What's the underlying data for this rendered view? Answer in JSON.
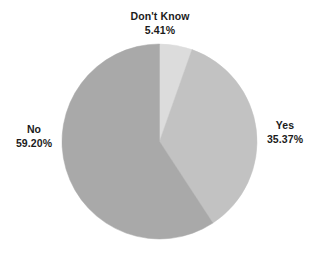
{
  "chart_data": {
    "type": "pie",
    "title": "",
    "subtitle": "",
    "xlabel": "",
    "ylabel": "",
    "legend_position": "none",
    "grid": false,
    "start_angle_deg": 0,
    "direction": "clockwise",
    "units": "percent",
    "categories": [
      "Don't Know",
      "Yes",
      "No"
    ],
    "values": [
      5.41,
      35.37,
      59.2
    ],
    "slices": [
      {
        "label": "Don't Know",
        "value": 5.41,
        "value_text": "5.41%",
        "color": "#dcdcdc",
        "start_deg": 0,
        "end_deg": 19.476,
        "label_position": "top"
      },
      {
        "label": "Yes",
        "value": 35.37,
        "value_text": "35.37%",
        "color": "#c2c2c2",
        "start_deg": 19.476,
        "end_deg": 146.808,
        "label_position": "right"
      },
      {
        "label": "No",
        "value": 59.2,
        "value_text": "59.20%",
        "color": "#a9a9a9",
        "start_deg": 146.808,
        "end_deg": 360,
        "label_position": "left"
      }
    ]
  },
  "labels": {
    "dont_know": {
      "category": "Don't Know",
      "percent": "5.41%"
    },
    "yes": {
      "category": "Yes",
      "percent": "35.37%"
    },
    "no": {
      "category": "No",
      "percent": "59.20%"
    }
  },
  "style": {
    "background": "#ffffff",
    "text_color": "#1b1b1b"
  }
}
